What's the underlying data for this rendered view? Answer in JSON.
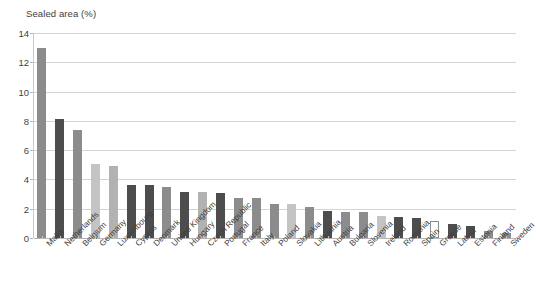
{
  "chart_data": {
    "type": "bar",
    "title": "Sealed area  (%)",
    "xlabel": "",
    "ylabel": "",
    "ylim": [
      0,
      14
    ],
    "yticks": [
      0,
      2,
      4,
      6,
      8,
      10,
      12,
      14
    ],
    "ytick_labels": [
      "0",
      "2",
      "4",
      "6",
      "8",
      "10",
      "12",
      "14"
    ],
    "grid": true,
    "legend": false,
    "categories": [
      "Malta",
      "Netherlands",
      "Belgium",
      "Germany",
      "Luxembourg",
      "Cyprus",
      "Denmark",
      "United Kingdom",
      "Hungary",
      "Czech Republic",
      "Portugal",
      "France",
      "Italy",
      "Poland",
      "Slovakia",
      "Lithuania",
      "Austria",
      "Bulgaria",
      "Slovenia",
      "Ireland",
      "Romania",
      "Spain",
      "Greece",
      "Latvia",
      "Estonia",
      "Finland",
      "Sweden"
    ],
    "values": [
      13.0,
      8.1,
      7.4,
      5.05,
      4.9,
      3.6,
      3.6,
      3.45,
      3.15,
      3.15,
      3.05,
      2.75,
      2.75,
      2.35,
      2.3,
      2.15,
      1.85,
      1.8,
      1.75,
      1.5,
      1.45,
      1.35,
      1.15,
      0.95,
      0.85,
      0.45,
      0.35
    ],
    "bar_colors": [
      "#8c8c8c",
      "#4d4d4d",
      "#8c8c8c",
      "#c4c4c4",
      "#b2b2b2",
      "#4d4d4d",
      "#4d4d4d",
      "#8c8c8c",
      "#4d4d4d",
      "#b2b2b2",
      "#4d4d4d",
      "#8c8c8c",
      "#8c8c8c",
      "#8c8c8c",
      "#c4c4c4",
      "#8c8c8c",
      "#4d4d4d",
      "#8c8c8c",
      "#8c8c8c",
      "#c4c4c4",
      "#4d4d4d",
      "#4d4d4d",
      "#ffffff",
      "#4d4d4d",
      "#4d4d4d",
      "#8c8c8c",
      "#8c8c8c"
    ],
    "bar_outline_color": "#8c8c8c",
    "gridline_color": "#d4d4d4",
    "axis_color": "#b5b5b5",
    "background_color": "#ffffff",
    "text_color": "#3f3f3f"
  }
}
